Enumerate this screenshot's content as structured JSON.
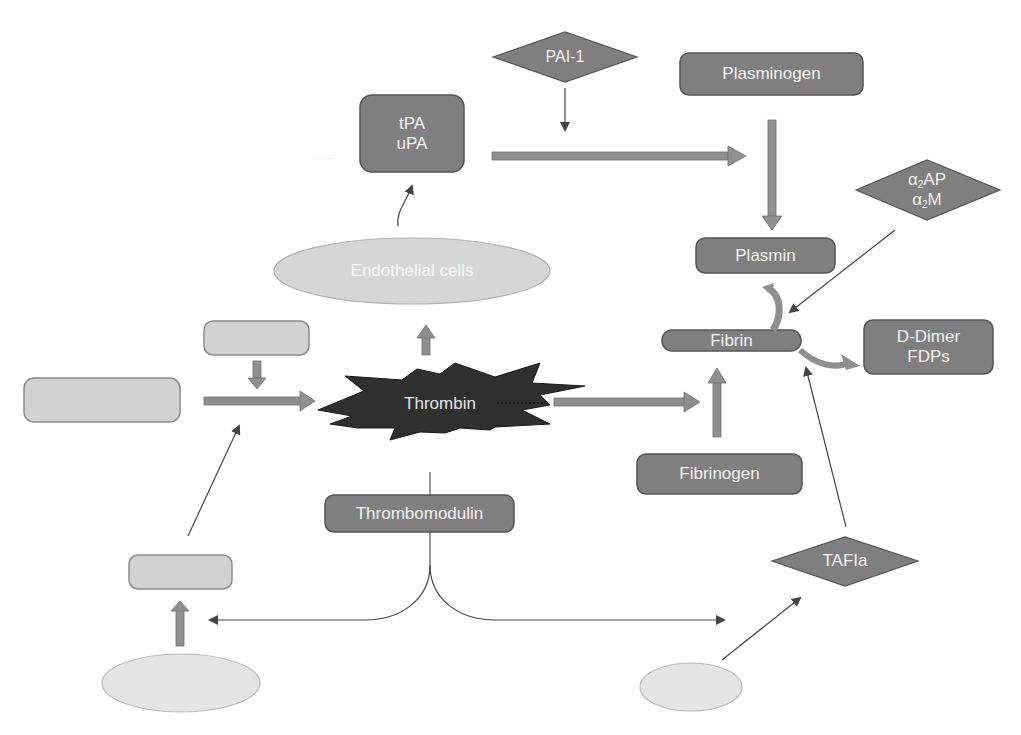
{
  "diagram": {
    "type": "fibrinolysis-coagulation-pathway",
    "colors": {
      "dark_node_fill": "#7f7f7f",
      "dark_node_stroke": "#555555",
      "light_node_fill": "#d2d2d2",
      "light_node_stroke": "#8a8a8a",
      "ellipse_fill": "#dadada",
      "ellipse_stroke": "#b5b5b5",
      "block_arrow_fill": "#8f8f8f",
      "thin_arrow": "#444444",
      "thrombin_fill": "#2f2f2f",
      "label_text": "#f2f2f2"
    },
    "nodes": {
      "pai1": {
        "label": "PAI-1",
        "shape": "diamond"
      },
      "tpa_upa": {
        "line1": "tPA",
        "line2": "uPA",
        "shape": "rounded-rect"
      },
      "plasminogen": {
        "label": "Plasminogen",
        "shape": "rounded-rect"
      },
      "alpha2": {
        "line1_greek": "α",
        "line1_sub": "2",
        "line1_rest": "AP",
        "line2_greek": "α",
        "line2_sub": "2",
        "line2_rest": "M",
        "shape": "diamond"
      },
      "plasmin": {
        "label": "Plasmin",
        "shape": "rounded-rect"
      },
      "fibrin": {
        "label": "Fibrin",
        "shape": "rounded-rect"
      },
      "ddimer": {
        "line1": "D-Dimer",
        "line2": "FDPs",
        "shape": "rounded-rect"
      },
      "endothelial": {
        "label": "Endothelial cells",
        "shape": "ellipse"
      },
      "thrombin": {
        "label": "Thrombin",
        "shape": "starburst"
      },
      "fibrinogen": {
        "label": "Fibrinogen",
        "shape": "rounded-rect"
      },
      "thrombomodulin": {
        "label": "Thrombomodulin",
        "shape": "rounded-rect"
      },
      "tafia": {
        "label": "TAFIa",
        "shape": "diamond"
      },
      "blank_small_top_left": {
        "label": "",
        "shape": "rounded-rect"
      },
      "blank_large_left": {
        "label": "",
        "shape": "rounded-rect"
      },
      "blank_lower_left": {
        "label": "",
        "shape": "rounded-rect"
      },
      "blank_ellipse_bottom_left": {
        "label": "",
        "shape": "ellipse"
      },
      "blank_ellipse_bottom_right": {
        "label": "",
        "shape": "ellipse"
      }
    },
    "edges": [
      {
        "from": "pai1",
        "to": "tpa_to_plasmin_arrow",
        "style": "thin"
      },
      {
        "from": "tpa_upa",
        "to": "plasmin",
        "style": "block"
      },
      {
        "from": "plasminogen",
        "to": "plasmin",
        "style": "block"
      },
      {
        "from": "alpha2",
        "to": "plasmin_fibrin",
        "style": "thin"
      },
      {
        "from": "plasmin",
        "to": "fibrin",
        "style": "curved-block"
      },
      {
        "from": "fibrin",
        "to": "ddimer",
        "style": "curved-block"
      },
      {
        "from": "endothelial",
        "to": "tpa_upa",
        "style": "thin-curved"
      },
      {
        "from": "thrombin",
        "to": "endothelial",
        "style": "block"
      },
      {
        "from": "thrombin",
        "to": "fibrin",
        "style": "block"
      },
      {
        "from": "fibrinogen",
        "to": "fibrin",
        "style": "block"
      },
      {
        "from": "tafia",
        "to": "fibrin",
        "style": "thin"
      },
      {
        "from": "blank_small_top_left",
        "to": "large_left_arrow",
        "style": "block"
      },
      {
        "from": "blank_large_left",
        "to": "thrombin",
        "style": "block"
      },
      {
        "from": "blank_lower_left",
        "to": "large_left_arrow",
        "style": "thin"
      },
      {
        "from": "blank_ellipse_bottom_left",
        "to": "blank_lower_left",
        "style": "block"
      },
      {
        "from": "thrombomodulin",
        "to": "blank_lower_left",
        "style": "thin-branch"
      },
      {
        "from": "thrombomodulin",
        "to": "blank_ellipse_bottom_right",
        "style": "thin-branch"
      },
      {
        "from": "blank_ellipse_bottom_right",
        "to": "tafia",
        "style": "thin"
      }
    ]
  }
}
